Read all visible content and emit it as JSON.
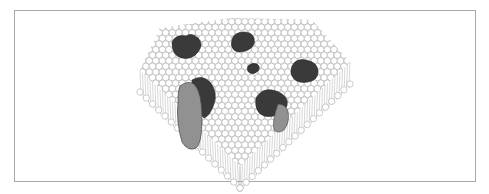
{
  "figure": {
    "components": {
      "bilayer": {
        "label": "phospholipid bilayer",
        "head_color": "#ffffff",
        "head_stroke": "#9a9a9a",
        "tail_color": "#b0b0b0"
      },
      "peripheral_proteins": {
        "label": "membrane proteins",
        "count": 6,
        "color": "#3a3a3a"
      },
      "integral_proteins": {
        "label": "transmembrane proteins",
        "count": 2,
        "face_color": "#8c8c8c",
        "top_color": "#3a3a3a"
      }
    },
    "frame_border_color": "#a9a9a9"
  }
}
